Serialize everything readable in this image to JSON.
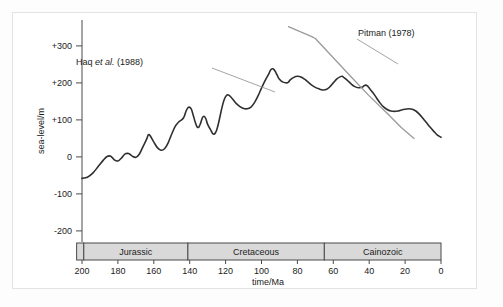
{
  "chart_data": {
    "type": "line",
    "title": "",
    "xlabel": "time/Ma",
    "ylabel": "sea-level/m",
    "xlim": [
      200,
      0
    ],
    "ylim": [
      -230,
      370
    ],
    "x_ticks": [
      "200",
      "180",
      "160",
      "140",
      "120",
      "100",
      "80",
      "60",
      "40",
      "20",
      "0"
    ],
    "x_tick_values": [
      200,
      180,
      160,
      140,
      120,
      100,
      80,
      60,
      40,
      20,
      0
    ],
    "y_ticks": [
      "+300",
      "+200",
      "+100",
      "0",
      "-100",
      "-200"
    ],
    "y_tick_values": [
      300,
      200,
      100,
      0,
      -100,
      -200
    ],
    "x_axis_direction": "reversed",
    "grid": "off",
    "legend": "inline-annotations",
    "series": [
      {
        "name": "Haq et al. (1988)",
        "color": "#2f2f2f",
        "width": 1.6,
        "points": [
          [
            200,
            -58
          ],
          [
            197,
            -55
          ],
          [
            194,
            -44
          ],
          [
            191,
            -26
          ],
          [
            188,
            -8
          ],
          [
            186,
            1
          ],
          [
            184,
            2
          ],
          [
            182,
            -8
          ],
          [
            180,
            -11
          ],
          [
            178,
            -3
          ],
          [
            176,
            8
          ],
          [
            174,
            9
          ],
          [
            172,
            2
          ],
          [
            170,
            -1
          ],
          [
            168,
            8
          ],
          [
            166,
            28
          ],
          [
            164,
            48
          ],
          [
            163,
            60
          ],
          [
            162,
            57
          ],
          [
            160,
            40
          ],
          [
            158,
            25
          ],
          [
            156,
            18
          ],
          [
            154,
            22
          ],
          [
            152,
            38
          ],
          [
            150,
            62
          ],
          [
            148,
            83
          ],
          [
            146,
            95
          ],
          [
            144,
            102
          ],
          [
            143,
            110
          ],
          [
            142,
            124
          ],
          [
            141,
            133
          ],
          [
            140,
            134
          ],
          [
            139,
            128
          ],
          [
            138,
            112
          ],
          [
            137,
            95
          ],
          [
            136,
            82
          ],
          [
            135,
            80
          ],
          [
            134,
            90
          ],
          [
            133,
            105
          ],
          [
            132,
            110
          ],
          [
            131,
            103
          ],
          [
            130,
            88
          ],
          [
            128,
            70
          ],
          [
            127,
            62
          ],
          [
            126,
            63
          ],
          [
            125,
            72
          ],
          [
            124,
            90
          ],
          [
            123,
            112
          ],
          [
            122,
            134
          ],
          [
            121,
            152
          ],
          [
            120,
            163
          ],
          [
            119,
            168
          ],
          [
            118,
            166
          ],
          [
            116,
            156
          ],
          [
            114,
            144
          ],
          [
            112,
            136
          ],
          [
            110,
            131
          ],
          [
            108,
            130
          ],
          [
            106,
            134
          ],
          [
            104,
            146
          ],
          [
            102,
            164
          ],
          [
            100,
            186
          ],
          [
            98,
            206
          ],
          [
            96,
            224
          ],
          [
            95,
            234
          ],
          [
            94,
            238
          ],
          [
            93,
            236
          ],
          [
            92,
            228
          ],
          [
            91,
            218
          ],
          [
            90,
            210
          ],
          [
            88,
            202
          ],
          [
            86,
            200
          ],
          [
            85,
            202
          ],
          [
            84,
            208
          ],
          [
            82,
            215
          ],
          [
            80,
            218
          ],
          [
            78,
            216
          ],
          [
            76,
            210
          ],
          [
            74,
            202
          ],
          [
            72,
            194
          ],
          [
            70,
            188
          ],
          [
            68,
            184
          ],
          [
            66,
            181
          ],
          [
            64,
            182
          ],
          [
            62,
            189
          ],
          [
            60,
            200
          ],
          [
            58,
            211
          ],
          [
            56,
            217
          ],
          [
            55,
            218
          ],
          [
            54,
            214
          ],
          [
            52,
            206
          ],
          [
            50,
            197
          ],
          [
            48,
            190
          ],
          [
            46,
            187
          ],
          [
            44,
            188
          ],
          [
            43,
            192
          ],
          [
            42,
            194
          ],
          [
            41,
            192
          ],
          [
            40,
            186
          ],
          [
            38,
            174
          ],
          [
            36,
            160
          ],
          [
            34,
            146
          ],
          [
            32,
            135
          ],
          [
            30,
            128
          ],
          [
            28,
            124
          ],
          [
            26,
            123
          ],
          [
            24,
            124
          ],
          [
            22,
            127
          ],
          [
            20,
            129
          ],
          [
            18,
            130
          ],
          [
            16,
            129
          ],
          [
            14,
            124
          ],
          [
            12,
            115
          ],
          [
            10,
            104
          ],
          [
            8,
            92
          ],
          [
            6,
            80
          ],
          [
            4,
            69
          ],
          [
            2,
            59
          ],
          [
            0,
            53
          ]
        ]
      },
      {
        "name": "Pitman (1978)",
        "color": "#9a9a9a",
        "width": 1.3,
        "points": [
          [
            85,
            352
          ],
          [
            72,
            325
          ],
          [
            70,
            320
          ],
          [
            60,
            268
          ],
          [
            50,
            216
          ],
          [
            40,
            165
          ],
          [
            30,
            118
          ],
          [
            22,
            79
          ],
          [
            15,
            50
          ]
        ]
      }
    ],
    "annotations": [
      {
        "id": "haq-annotation",
        "text_main": "Haq ",
        "text_italic": "et al.",
        "text_tail": " (1988)",
        "full_text": "Haq et al. (1988)",
        "text_x": 143,
        "text_y": 65,
        "leader_from": [
          212,
          68
        ],
        "leader_to": [
          275,
          92
        ]
      },
      {
        "id": "pitman-annotation",
        "text_main": "Pitman (1978)",
        "full_text": "Pitman (1978)",
        "text_x": 358,
        "text_y": 36,
        "leader_from": [
          357,
          39
        ],
        "leader_to": [
          398,
          64
        ]
      }
    ],
    "period_bar": {
      "y_top": 243,
      "height": 17,
      "fill": "#d9d9d9",
      "stroke": "#4a4a4a",
      "segments": [
        {
          "label": "",
          "start_ma": 203,
          "end_ma": 199,
          "name": "triassic-sliver"
        },
        {
          "label": "Jurassic",
          "start_ma": 199,
          "end_ma": 141,
          "name": "jurassic"
        },
        {
          "label": "Cretaceous",
          "start_ma": 141,
          "end_ma": 65,
          "name": "cretaceous"
        },
        {
          "label": "Cainozoic",
          "start_ma": 65,
          "end_ma": 0,
          "name": "cainozoic"
        }
      ]
    }
  }
}
